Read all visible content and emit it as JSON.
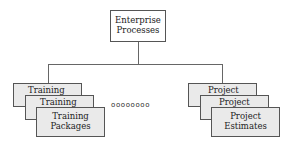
{
  "diagram": {
    "root": {
      "line1": "Enterprise",
      "line2": "Processes"
    },
    "left_stack": {
      "back": "Training",
      "middle": "Training",
      "front": {
        "line1": "Training",
        "line2": "Packages"
      }
    },
    "ellipsis": "oooooooo",
    "right_stack": {
      "back": "Project",
      "middle": "Project",
      "front": {
        "line1": "Project",
        "line2": "Estimates"
      }
    }
  }
}
